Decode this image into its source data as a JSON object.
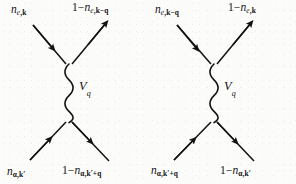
{
  "figure": {
    "type": "feynman-diagram-pair",
    "background_color": "#fcfcfb",
    "ink_color": "#121212",
    "diagram_count": 2
  },
  "diagrams": [
    {
      "id": "left",
      "name": "direct-scattering-diagram",
      "interaction_label": {
        "symbol": "V",
        "subscript": "q",
        "text": "Vq"
      },
      "interaction_line": {
        "style": "wavy",
        "orientation": "vertical"
      },
      "legs": [
        {
          "position": "top-left",
          "arrow_direction": "inward",
          "label": {
            "prefix": "",
            "symbol": "n",
            "sub_first": "e",
            "sub_rest": ",k",
            "text": "n e,k"
          }
        },
        {
          "position": "top-right",
          "arrow_direction": "outward",
          "label": {
            "prefix": "1−",
            "symbol": "n",
            "sub_first": "e",
            "sub_rest": ",k−q",
            "text": "1−n e,k−q"
          }
        },
        {
          "position": "bottom-left",
          "arrow_direction": "inward",
          "label": {
            "prefix": "",
            "symbol": "n",
            "sub_first": "α",
            "sub_rest": ",k′",
            "text": "n α,k′"
          }
        },
        {
          "position": "bottom-right",
          "arrow_direction": "outward",
          "label": {
            "prefix": "1−",
            "symbol": "n",
            "sub_first": "α",
            "sub_rest": ",k′+q",
            "text": "1−n α,k′+q"
          }
        }
      ]
    },
    {
      "id": "right",
      "name": "exchange-scattering-diagram",
      "interaction_label": {
        "symbol": "V",
        "subscript": "q",
        "text": "Vq"
      },
      "interaction_line": {
        "style": "wavy",
        "orientation": "vertical"
      },
      "legs": [
        {
          "position": "top-left",
          "arrow_direction": "inward",
          "label": {
            "prefix": "",
            "symbol": "n",
            "sub_first": "e",
            "sub_rest": ",k−q",
            "text": "n e,k−q"
          }
        },
        {
          "position": "top-right",
          "arrow_direction": "outward",
          "label": {
            "prefix": "1−",
            "symbol": "n",
            "sub_first": "e",
            "sub_rest": ",k",
            "text": "1−n e,k"
          }
        },
        {
          "position": "bottom-left",
          "arrow_direction": "inward",
          "label": {
            "prefix": "",
            "symbol": "n",
            "sub_first": "α",
            "sub_rest": ",k′+q",
            "text": "n α,k′+q"
          }
        },
        {
          "position": "bottom-right",
          "arrow_direction": "outward",
          "label": {
            "prefix": "1−",
            "symbol": "n",
            "sub_first": "α",
            "sub_rest": ",k′",
            "text": "1−n α,k′"
          }
        }
      ]
    }
  ]
}
